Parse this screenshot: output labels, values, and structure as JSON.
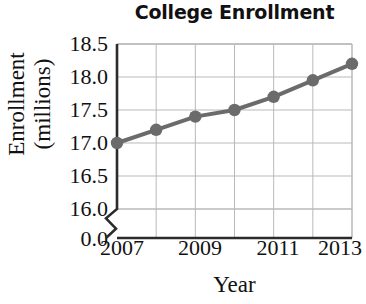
{
  "chart_data": {
    "type": "line",
    "title": "College Enrollment",
    "xlabel": "Year",
    "ylabel": "Enrollment (millions)",
    "ylabel_lines": [
      "Enrollment",
      "(millions)"
    ],
    "x": [
      2007,
      2008,
      2009,
      2010,
      2011,
      2012,
      2013
    ],
    "values": [
      17.0,
      17.2,
      17.4,
      17.5,
      17.7,
      17.95,
      18.2
    ],
    "series": [
      {
        "name": "College Enrollment",
        "values": [
          17.0,
          17.2,
          17.4,
          17.5,
          17.7,
          17.95,
          18.2
        ]
      }
    ],
    "xtick_labels": [
      "2007",
      "2009",
      "2011",
      "2013"
    ],
    "xtick_values": [
      2007,
      2009,
      2011,
      2013
    ],
    "ytick_labels": [
      "18.5",
      "18.0",
      "17.5",
      "17.0",
      "16.5",
      "16.0",
      "0.0"
    ],
    "ytick_values": [
      18.5,
      18.0,
      17.5,
      17.0,
      16.5,
      16.0,
      0.0
    ],
    "xlim": [
      2007,
      2013
    ],
    "ylim": [
      16.0,
      18.5
    ],
    "axis_break": true,
    "axis_break_between": [
      0.0,
      16.0
    ],
    "grid": true,
    "legend": false,
    "marker": "circle",
    "colors": {
      "line": "#6b6b6b",
      "marker": "#6b6b6b",
      "grid": "#b9b9b9",
      "axis": "#2b2b2b",
      "text": "#111111",
      "background": "#ffffff"
    }
  }
}
